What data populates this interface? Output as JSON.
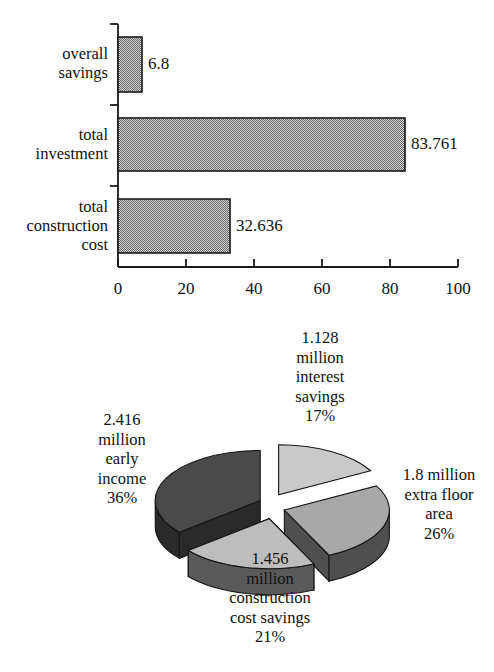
{
  "chart_data": [
    {
      "type": "bar",
      "orientation": "horizontal",
      "title": "",
      "xlabel": "",
      "ylabel": "",
      "categories": [
        "overall savings",
        "total investment",
        "total construction cost"
      ],
      "category_lines": [
        [
          "overall",
          "savings"
        ],
        [
          "total",
          "investment"
        ],
        [
          "total",
          "construction",
          "cost"
        ]
      ],
      "values": [
        6.8,
        83.761,
        32.636
      ],
      "value_labels": [
        "6.8",
        "83.761",
        "32.636"
      ],
      "xlim": [
        0,
        100
      ],
      "xticks": [
        0,
        20,
        40,
        60,
        80,
        100
      ],
      "xtick_labels": [
        "0",
        "20",
        "40",
        "60",
        "80",
        "100"
      ],
      "grid": false,
      "legend": "none",
      "bar_fill": "#9a9a9a",
      "bar_stroke": "#1a1a1a",
      "axis_color": "#1a1a1a"
    },
    {
      "type": "pie",
      "style": "exploded-3d",
      "title": "",
      "labels": [
        "1.128 million interest savings",
        "1.8 million extra floor area",
        "1.456 million construction cost savings",
        "2.416 million early income"
      ],
      "values": [
        1.128,
        1.8,
        1.456,
        2.416
      ],
      "percent_labels": [
        "17%",
        "26%",
        "21%",
        "36%"
      ],
      "percents": [
        17,
        26,
        21,
        36
      ],
      "slice_colors": [
        "#c9c9c9",
        "#a8a8a8",
        "#bdbdbd",
        "#4a4a4a"
      ],
      "slice_side_colors": [
        "#6f6f6f",
        "#4f4f4f",
        "#5a5a5a",
        "#2a2a2a"
      ],
      "legend": "labels-around-slices",
      "slice_label_lines": [
        [
          "1.128",
          "million",
          "interest",
          "savings",
          "17%"
        ],
        [
          "1.8 million",
          "extra floor",
          "area",
          "26%"
        ],
        [
          "1.456",
          "million",
          "construction",
          "cost savings",
          "21%"
        ],
        [
          "2.416",
          "million",
          "early",
          "income",
          "36%"
        ]
      ]
    }
  ],
  "bar_chart": {
    "cat0_line0": "overall",
    "cat0_line1": "savings",
    "cat1_line0": "total",
    "cat1_line1": "investment",
    "cat2_line0": "total",
    "cat2_line1": "construction",
    "cat2_line2": "cost",
    "val0": "6.8",
    "val1": "83.761",
    "val2": "32.636",
    "tick0": "0",
    "tick1": "20",
    "tick2": "40",
    "tick3": "60",
    "tick4": "80",
    "tick5": "100"
  },
  "pie_chart": {
    "top_l0": "1.128",
    "top_l1": "million",
    "top_l2": "interest",
    "top_l3": "savings",
    "top_l4": "17%",
    "right_l0": "1.8 million",
    "right_l1": "extra floor",
    "right_l2": "area",
    "right_l3": "26%",
    "bottom_l0": "1.456",
    "bottom_l1": "million",
    "bottom_l2": "construction",
    "bottom_l3": "cost savings",
    "bottom_l4": "21%",
    "left_l0": "2.416",
    "left_l1": "million",
    "left_l2": "early",
    "left_l3": "income",
    "left_l4": "36%"
  }
}
